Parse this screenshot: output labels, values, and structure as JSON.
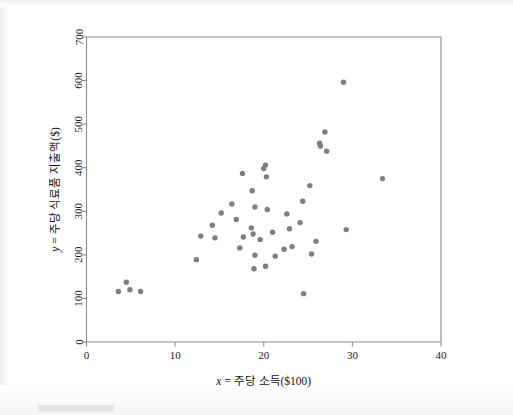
{
  "figure": {
    "background_color": "#ffffff",
    "frame_color": "#8b8b8b",
    "dot_color": "#7d7d82"
  },
  "chart_data": {
    "type": "scatter",
    "title": "",
    "xlabel": "x = 주당 소득($100)",
    "ylabel": "y = 주당 식료품 지출액($)",
    "xlabel_italic_prefix": "x",
    "ylabel_italic_prefix": "y",
    "xlim": [
      0,
      40
    ],
    "ylim": [
      0,
      700
    ],
    "xticks": [
      0,
      10,
      20,
      30,
      40
    ],
    "yticks": [
      0,
      100,
      200,
      300,
      400,
      500,
      600,
      700
    ],
    "xtick_labels": [
      "0",
      "10",
      "20",
      "30",
      "40"
    ],
    "ytick_labels": [
      "0",
      "100",
      "200",
      "300",
      "400",
      "500",
      "600",
      "700"
    ],
    "grid": false,
    "legend": null,
    "marker": "circle",
    "marker_size": 3.6,
    "n_points": 45,
    "points": [
      [
        3.6,
        116
      ],
      [
        4.5,
        137
      ],
      [
        4.9,
        120
      ],
      [
        6.1,
        116
      ],
      [
        12.4,
        189
      ],
      [
        12.9,
        243
      ],
      [
        14.2,
        268
      ],
      [
        14.5,
        239
      ],
      [
        15.2,
        296
      ],
      [
        16.4,
        317
      ],
      [
        17.3,
        216
      ],
      [
        17.6,
        387
      ],
      [
        17.7,
        241
      ],
      [
        18.6,
        262
      ],
      [
        18.7,
        347
      ],
      [
        18.8,
        248
      ],
      [
        19.0,
        310
      ],
      [
        19.0,
        199
      ],
      [
        18.9,
        168
      ],
      [
        20.0,
        398
      ],
      [
        20.2,
        406
      ],
      [
        20.3,
        379
      ],
      [
        20.4,
        304
      ],
      [
        20.2,
        174
      ],
      [
        21.3,
        197
      ],
      [
        22.3,
        213
      ],
      [
        22.6,
        294
      ],
      [
        22.9,
        260
      ],
      [
        24.1,
        274
      ],
      [
        24.4,
        323
      ],
      [
        24.5,
        111
      ],
      [
        25.2,
        359
      ],
      [
        25.4,
        202
      ],
      [
        26.3,
        456
      ],
      [
        26.4,
        450
      ],
      [
        26.9,
        482
      ],
      [
        27.1,
        438
      ],
      [
        29.0,
        596
      ],
      [
        29.3,
        258
      ],
      [
        33.4,
        375
      ],
      [
        23.2,
        219
      ],
      [
        19.6,
        235
      ],
      [
        21.0,
        252
      ],
      [
        16.9,
        281
      ],
      [
        25.9,
        231
      ]
    ]
  }
}
